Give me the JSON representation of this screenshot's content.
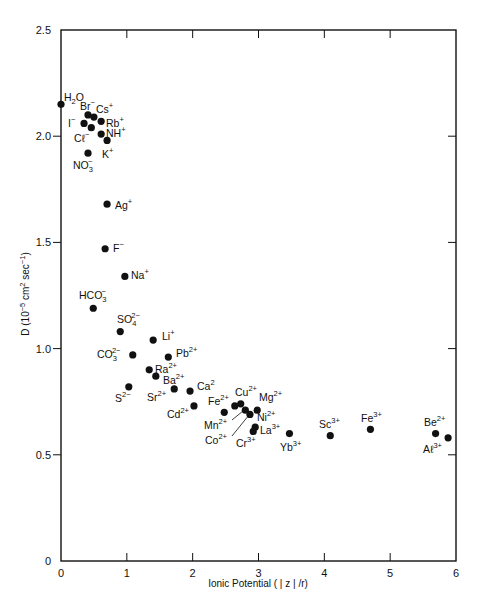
{
  "chart_data": {
    "type": "scatter",
    "title": "",
    "xlabel": "Ionic Potential ( | z | /r)",
    "ylabel": "D (10^-5 cm^2 sec^-1)",
    "ylabel_parts": {
      "pre": "D (10",
      "exp1": "−5",
      "mid": " cm",
      "exp2": "2",
      "mid2": " sec",
      "exp3": "−1",
      "post": ")"
    },
    "xlim": [
      0,
      6
    ],
    "ylim": [
      0,
      2.5
    ],
    "xticks": [
      0,
      1,
      2,
      3,
      4,
      5,
      6
    ],
    "xtick_labels": [
      "0",
      "1",
      "2",
      "3",
      "4",
      "5",
      "6"
    ],
    "yticks": [
      0,
      0.5,
      1.0,
      1.5,
      2.0,
      2.5
    ],
    "ytick_labels": [
      "0",
      "0.5",
      "1.0",
      "1.5",
      "2.0",
      "2.5"
    ],
    "grid": false,
    "legend": null,
    "marker_color": "#111111",
    "points": [
      {
        "label": "H2O",
        "base": "H",
        "sub": "2",
        "rest": "O",
        "sup": "",
        "x": 0.0,
        "y": 2.15,
        "lx": 64,
        "ly": 101
      },
      {
        "label": "Br-",
        "base": "Br",
        "sub": "",
        "rest": "",
        "sup": "−",
        "x": 0.41,
        "y": 2.1,
        "lx": 80,
        "ly": 110
      },
      {
        "label": "Cs+",
        "base": "Cs",
        "sub": "",
        "rest": "",
        "sup": "+",
        "x": 0.5,
        "y": 2.09,
        "lx": 96,
        "ly": 113
      },
      {
        "label": "I-",
        "base": "I",
        "sub": "",
        "rest": "",
        "sup": "−",
        "x": 0.35,
        "y": 2.06,
        "lx": 68,
        "ly": 127
      },
      {
        "label": "Rb+",
        "base": "Rb",
        "sub": "",
        "rest": "",
        "sup": "+",
        "x": 0.61,
        "y": 2.07,
        "lx": 106,
        "ly": 127
      },
      {
        "label": "Cl-",
        "base": "Cℓ",
        "sub": "",
        "rest": "",
        "sup": "−",
        "x": 0.46,
        "y": 2.04,
        "lx": 74,
        "ly": 142
      },
      {
        "label": "NH+",
        "base": "NH",
        "sub": "",
        "rest": "",
        "sup": "+",
        "x": 0.61,
        "y": 2.01,
        "lx": 106,
        "ly": 137
      },
      {
        "label": "K+",
        "base": "K",
        "sub": "",
        "rest": "",
        "sup": "+",
        "x": 0.7,
        "y": 1.98,
        "lx": 102,
        "ly": 158
      },
      {
        "label": "NO3-",
        "base": "NO",
        "sub": "3",
        "rest": "",
        "sup": "−",
        "x": 0.41,
        "y": 1.92,
        "lx": 73,
        "ly": 169
      },
      {
        "label": "Ag+",
        "base": "Ag",
        "sub": "",
        "rest": "",
        "sup": "+",
        "x": 0.7,
        "y": 1.68,
        "lx": 115,
        "ly": 209
      },
      {
        "label": "F-",
        "base": "F",
        "sub": "",
        "rest": "",
        "sup": "−",
        "x": 0.67,
        "y": 1.47,
        "lx": 113,
        "ly": 252
      },
      {
        "label": "Na+",
        "base": "Na",
        "sub": "",
        "rest": "",
        "sup": "+",
        "x": 0.97,
        "y": 1.34,
        "lx": 131,
        "ly": 279
      },
      {
        "label": "HCO3-",
        "base": "HCO",
        "sub": "3",
        "rest": "",
        "sup": "−",
        "x": 0.49,
        "y": 1.19,
        "lx": 79,
        "ly": 299
      },
      {
        "label": "SO4 2-",
        "base": "SO",
        "sub": "4",
        "rest": "",
        "sup": "2−",
        "x": 0.9,
        "y": 1.08,
        "lx": 117,
        "ly": 323
      },
      {
        "label": "Li+",
        "base": "Li",
        "sub": "",
        "rest": "",
        "sup": "+",
        "x": 1.4,
        "y": 1.04,
        "lx": 162,
        "ly": 340
      },
      {
        "label": "CO3 2-",
        "base": "CO",
        "sub": "3",
        "rest": "",
        "sup": "2−",
        "x": 1.09,
        "y": 0.97,
        "lx": 97,
        "ly": 358
      },
      {
        "label": "Pb2+",
        "base": "Pb",
        "sub": "",
        "rest": "",
        "sup": "2+",
        "x": 1.63,
        "y": 0.96,
        "lx": 176,
        "ly": 357
      },
      {
        "label": "Ra2+",
        "base": "Ra",
        "sub": "",
        "rest": "",
        "sup": "2+",
        "x": 1.34,
        "y": 0.9,
        "lx": 155,
        "ly": 373
      },
      {
        "label": "Ba2+",
        "base": "Ba",
        "sub": "",
        "rest": "",
        "sup": "2+",
        "x": 1.44,
        "y": 0.87,
        "lx": 163,
        "ly": 384
      },
      {
        "label": "S2-",
        "base": "S",
        "sub": "",
        "rest": "",
        "sup": "2−",
        "x": 1.03,
        "y": 0.82,
        "lx": 115,
        "ly": 402
      },
      {
        "label": "Sr2+",
        "base": "Sr",
        "sub": "",
        "rest": "",
        "sup": "2+",
        "x": 1.72,
        "y": 0.81,
        "lx": 147,
        "ly": 401
      },
      {
        "label": "Ca2",
        "base": "Ca",
        "sub": "",
        "rest": "",
        "sup": "2",
        "x": 1.96,
        "y": 0.8,
        "lx": 197,
        "ly": 390
      },
      {
        "label": "Cd2+",
        "base": "Cd",
        "sub": "",
        "rest": "",
        "sup": "2+",
        "x": 2.02,
        "y": 0.73,
        "lx": 167,
        "ly": 418
      },
      {
        "label": "Fe2+",
        "base": "Fe",
        "sub": "",
        "rest": "",
        "sup": "2+",
        "x": 2.48,
        "y": 0.7,
        "lx": 208,
        "ly": 405
      },
      {
        "label": "Mn2+",
        "base": "Mn",
        "sub": "",
        "rest": "",
        "sup": "2+",
        "x": 2.64,
        "y": 0.73,
        "lx": 204,
        "ly": 429,
        "leader": [
          232,
          420,
          243,
          411
        ]
      },
      {
        "label": "Cu2+",
        "base": "Cu",
        "sub": "",
        "rest": "",
        "sup": "2+",
        "x": 2.73,
        "y": 0.74,
        "lx": 235,
        "ly": 396
      },
      {
        "label": "Co2+",
        "base": "Co",
        "sub": "",
        "rest": "",
        "sup": "2+",
        "x": 2.8,
        "y": 0.71,
        "lx": 205,
        "ly": 444,
        "leader": [
          232,
          436,
          249,
          415
        ]
      },
      {
        "label": "Ni2+",
        "base": "Ni",
        "sub": "",
        "rest": "",
        "sup": "2+",
        "x": 2.87,
        "y": 0.69,
        "lx": 257,
        "ly": 421
      },
      {
        "label": "Mg2+",
        "base": "Mg",
        "sub": "",
        "rest": "",
        "sup": "2+",
        "x": 2.98,
        "y": 0.71,
        "lx": 259,
        "ly": 401
      },
      {
        "label": "La3+",
        "base": "La",
        "sub": "",
        "rest": "",
        "sup": "3+",
        "x": 2.95,
        "y": 0.63,
        "lx": 260,
        "ly": 434
      },
      {
        "label": "Cr3+",
        "base": "Cr",
        "sub": "",
        "rest": "",
        "sup": "3+",
        "x": 2.92,
        "y": 0.61,
        "lx": 236,
        "ly": 447
      },
      {
        "label": "Yb3+",
        "base": "Yb",
        "sub": "",
        "rest": "",
        "sup": "3+",
        "x": 3.47,
        "y": 0.6,
        "lx": 280,
        "ly": 451
      },
      {
        "label": "Sc3+",
        "base": "Sc",
        "sub": "",
        "rest": "",
        "sup": "3+",
        "x": 4.09,
        "y": 0.59,
        "lx": 319,
        "ly": 428
      },
      {
        "label": "Fe3+",
        "base": "Fe",
        "sub": "",
        "rest": "",
        "sup": "3+",
        "x": 4.7,
        "y": 0.62,
        "lx": 361,
        "ly": 422
      },
      {
        "label": "Be2+",
        "base": "Be",
        "sub": "",
        "rest": "",
        "sup": "2+",
        "x": 5.69,
        "y": 0.6,
        "lx": 424,
        "ly": 426
      },
      {
        "label": "Al3+",
        "base": "Aℓ",
        "sub": "",
        "rest": "",
        "sup": "3+",
        "x": 5.88,
        "y": 0.58,
        "lx": 423,
        "ly": 453
      }
    ]
  },
  "layout": {
    "plot": {
      "left": 61,
      "right": 456,
      "top": 30,
      "bottom": 561
    }
  }
}
